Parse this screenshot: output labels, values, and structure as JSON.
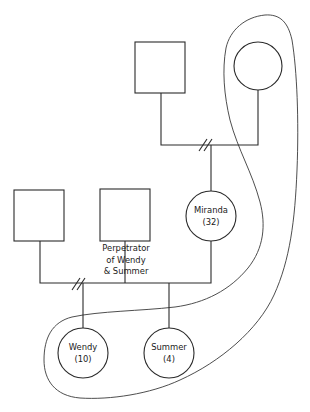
{
  "diagram": {
    "type": "genogram",
    "people": [
      {
        "id": "grandfather",
        "shape": "square",
        "label": ""
      },
      {
        "id": "grandmother",
        "shape": "circle",
        "label": ""
      },
      {
        "id": "miranda",
        "shape": "circle",
        "name": "Miranda",
        "age": "(32)"
      },
      {
        "id": "left-male",
        "shape": "square",
        "label": ""
      },
      {
        "id": "perpetrator",
        "shape": "square",
        "caption_lines": [
          "Perpetrator",
          "of Wendy",
          "& Summer"
        ]
      },
      {
        "id": "wendy",
        "shape": "circle",
        "name": "Wendy",
        "age": "(10)"
      },
      {
        "id": "summer",
        "shape": "circle",
        "name": "Summer",
        "age": "(4)"
      }
    ],
    "relationships": [
      {
        "between": [
          "grandfather",
          "grandmother"
        ],
        "status": "divorced",
        "child": "miranda"
      },
      {
        "between": [
          "left-male",
          "miranda"
        ],
        "status": "divorced",
        "child": "wendy"
      },
      {
        "between": [
          "perpetrator",
          "miranda"
        ],
        "status": "partner",
        "child": "summer"
      }
    ],
    "boundary": {
      "encloses": [
        "grandmother",
        "miranda",
        "wendy",
        "summer"
      ]
    }
  }
}
